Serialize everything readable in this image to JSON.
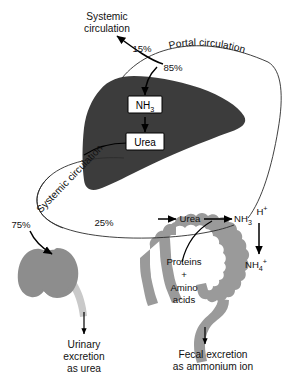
{
  "figure": {
    "type": "biological-pathway-diagram"
  },
  "colors": {
    "liver": "#3c3c3c",
    "intestine": "#9a9a9a",
    "kidney": "#8d8d8d",
    "ureter": "#c9c9c9",
    "line": "#2b2b2b",
    "arrow": "#000000",
    "text": "#111111",
    "background": "#ffffff"
  },
  "labels": {
    "systemic_circulation_top": "Systemic\ncirculation",
    "systemic_circulation_top_line1": "Systemic",
    "systemic_circulation_top_line2": "circulation",
    "portal_circulation": "Portal circulation",
    "systemic_circulation_diagonal": "Systemic circulation",
    "pct_15": "15%",
    "pct_85": "85%",
    "pct_25": "25%",
    "pct_75": "75%"
  },
  "liver": {
    "name": "liver",
    "nodes": [
      {
        "id": "nh3",
        "label": "NH",
        "sub": "3",
        "full": "NH3"
      },
      {
        "id": "urea",
        "label": "Urea",
        "sub": "",
        "full": "Urea"
      }
    ]
  },
  "intestine": {
    "name": "intestine",
    "nodes": [
      {
        "id": "urea",
        "label": "Urea"
      },
      {
        "id": "nh3",
        "label": "NH",
        "sub": "3"
      },
      {
        "id": "hplus",
        "label": "H",
        "sup": "+"
      },
      {
        "id": "nh4",
        "label": "NH",
        "sub": "4",
        "sup": "+"
      }
    ],
    "substrate_line1": "Proteins",
    "substrate_plus": "+",
    "substrate_line2": "Amino",
    "substrate_line3": "acids"
  },
  "kidney": {
    "name": "kidney",
    "excretion_line1": "Urinary",
    "excretion_line2": "excretion",
    "excretion_line3": "as urea"
  },
  "fecal": {
    "excretion_line1": "Fecal excretion",
    "excretion_line2": "as ammonium ion"
  }
}
